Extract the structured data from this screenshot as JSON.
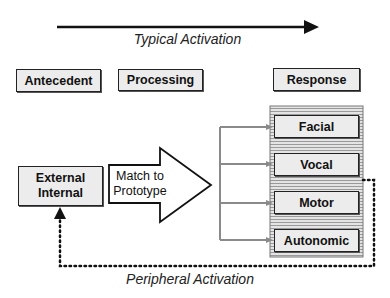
{
  "diagram": {
    "top_arrow": {
      "label": "Typical Activation"
    },
    "bottom_arrow": {
      "label": "Peripheral Activation"
    },
    "stage_headers": [
      {
        "id": "antecedent",
        "label": "Antecedent"
      },
      {
        "id": "processing",
        "label": "Processing"
      },
      {
        "id": "response",
        "label": "Response"
      }
    ],
    "antecedent_box": {
      "line1": "External",
      "line2": "Internal"
    },
    "processing_arrow": {
      "line1": "Match to",
      "line2": "Prototype"
    },
    "responses": [
      {
        "label": "Facial"
      },
      {
        "label": "Vocal"
      },
      {
        "label": "Motor"
      },
      {
        "label": "Autonomic"
      }
    ],
    "colors": {
      "box_fill": "#ececec",
      "stroke": "#222222",
      "branch_lines": "#8a8a8a",
      "panel_stripes": "#9a9a9a"
    }
  }
}
